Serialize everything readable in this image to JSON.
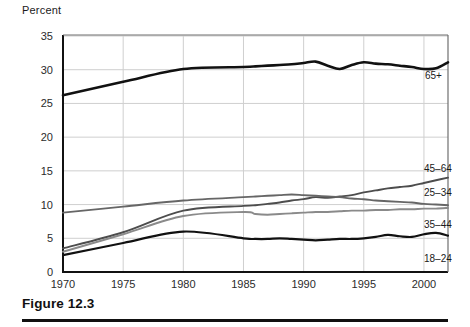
{
  "figure": {
    "caption": "Figure 12.3",
    "axis_title": "Percent"
  },
  "chart_data": {
    "type": "line",
    "title": "",
    "subtitle": "",
    "xlabel": "",
    "ylabel": "Percent",
    "xlim": [
      1970,
      2002
    ],
    "ylim": [
      0,
      35
    ],
    "grid": true,
    "legend_position": "right-inline-labels",
    "x_ticks": [
      1970,
      1975,
      1980,
      1985,
      1990,
      1995,
      2000
    ],
    "x_tick_labels": [
      "1970",
      "1975",
      "1980",
      "1985",
      "1990",
      "1995",
      "2000"
    ],
    "y_ticks": [
      0,
      5,
      10,
      15,
      20,
      25,
      30,
      35
    ],
    "y_tick_labels": [
      "0",
      "5",
      "10",
      "15",
      "20",
      "25",
      "30",
      "35"
    ],
    "x": [
      1970,
      1975,
      1980,
      1985,
      1986,
      1987,
      1988,
      1989,
      1990,
      1991,
      1992,
      1993,
      1994,
      1995,
      1996,
      1997,
      1998,
      1999,
      2000,
      2001,
      2002
    ],
    "series": [
      {
        "name": "65+",
        "label": "65+",
        "color": "#111111",
        "width": 2.6,
        "values": [
          26.2,
          28.2,
          30.1,
          30.4,
          30.5,
          30.6,
          30.7,
          30.8,
          31.0,
          31.2,
          30.6,
          30.1,
          30.7,
          31.1,
          30.9,
          30.8,
          30.6,
          30.4,
          30.1,
          30.2,
          31.1
        ]
      },
      {
        "name": "45-64",
        "label": "45–64",
        "color": "#4d4d4d",
        "width": 1.9,
        "values": [
          3.5,
          5.9,
          9.1,
          9.8,
          9.9,
          10.1,
          10.3,
          10.6,
          10.8,
          11.1,
          11.0,
          11.2,
          11.4,
          11.8,
          12.1,
          12.4,
          12.6,
          12.8,
          13.2,
          13.6,
          14.0
        ]
      },
      {
        "name": "25-34",
        "label": "25–34",
        "color": "#666666",
        "width": 1.9,
        "values": [
          8.8,
          9.7,
          10.6,
          11.1,
          11.2,
          11.3,
          11.4,
          11.5,
          11.4,
          11.3,
          11.2,
          11.1,
          10.9,
          10.8,
          10.6,
          10.5,
          10.4,
          10.3,
          10.1,
          10.0,
          9.9
        ]
      },
      {
        "name": "35-44",
        "label": "35–44",
        "color": "#8a8a8a",
        "width": 1.9,
        "values": [
          3.0,
          5.6,
          8.3,
          8.9,
          8.6,
          8.5,
          8.6,
          8.7,
          8.8,
          8.9,
          8.9,
          9.0,
          9.1,
          9.1,
          9.2,
          9.2,
          9.3,
          9.3,
          9.4,
          9.4,
          9.5
        ]
      },
      {
        "name": "18-24",
        "label": "18–24",
        "color": "#111111",
        "width": 2.2,
        "values": [
          2.5,
          4.3,
          6.0,
          5.0,
          4.9,
          4.9,
          5.0,
          4.9,
          4.8,
          4.7,
          4.8,
          4.9,
          4.9,
          5.0,
          5.2,
          5.5,
          5.3,
          5.2,
          5.6,
          5.8,
          5.4
        ]
      }
    ],
    "series_label_positions": [
      {
        "name": "65+",
        "x": 425,
        "y": 79
      },
      {
        "name": "45-64",
        "x": 424,
        "y": 172
      },
      {
        "name": "25-34",
        "x": 424,
        "y": 196
      },
      {
        "name": "35-44",
        "x": 424,
        "y": 228
      },
      {
        "name": "18-24",
        "x": 424,
        "y": 262
      }
    ]
  }
}
